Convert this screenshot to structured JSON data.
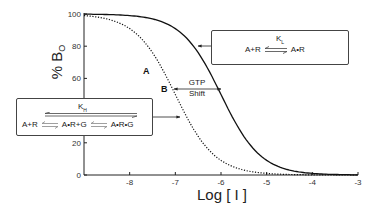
{
  "chart_data": {
    "type": "line",
    "title": "",
    "xlabel": "Log [ I ]",
    "ylabel": "% B₀",
    "xlim": [
      -9,
      -3
    ],
    "ylim": [
      0,
      100
    ],
    "xticks": [
      -8,
      -7,
      -6,
      -5,
      -4,
      -3
    ],
    "yticks": [
      0,
      20,
      40,
      60,
      80,
      100
    ],
    "grid": false,
    "legend": null,
    "series": [
      {
        "name": "A (solid)",
        "style": "solid",
        "ic50_log": -6.0,
        "hill": 1.0,
        "x": [
          -9,
          -8,
          -7,
          -6.5,
          -6,
          -5.5,
          -5,
          -4,
          -3
        ],
        "values": [
          99.9,
          99,
          91,
          76,
          50,
          24,
          9,
          1,
          0.1
        ]
      },
      {
        "name": "B (dotted)",
        "style": "dotted",
        "ic50_log": -7.0,
        "hill": 1.0,
        "x": [
          -9,
          -8,
          -7.5,
          -7,
          -6.5,
          -6,
          -5,
          -4,
          -3
        ],
        "values": [
          99,
          91,
          76,
          50,
          24,
          9,
          1,
          0.1,
          0
        ]
      }
    ],
    "annotations": [
      {
        "text": "A",
        "near": "solid curve"
      },
      {
        "text": "B",
        "near": "dotted curve"
      },
      {
        "text": "GTP Shift",
        "type": "double-arrow",
        "between": [
          "B",
          "A"
        ],
        "y": 53
      }
    ]
  },
  "labels": {
    "xlabel": "Log [ I ]",
    "ylabel_main": "% B",
    "ylabel_sub": "O",
    "curve_a": "A",
    "curve_b": "B",
    "gtp_line1": "GTP",
    "gtp_line2": "Shift"
  },
  "box_low": {
    "k_main": "K",
    "k_sub": "L",
    "left": "A+R",
    "right": "A•R"
  },
  "box_high": {
    "k_main": "K",
    "k_sub": "H",
    "left": "A+R",
    "mid": "A•R+G",
    "right": "A•R•G"
  },
  "colors": {
    "line": "#111111",
    "axis": "#222222"
  }
}
